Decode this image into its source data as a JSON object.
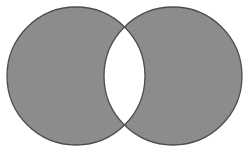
{
  "diagram": {
    "type": "venn",
    "sets": [
      {
        "name": "set-a",
        "shaded": true
      },
      {
        "name": "set-b",
        "shaded": true
      }
    ],
    "intersection_shaded": false,
    "colors": {
      "fill": "#8c8c8c",
      "stroke": "#4d4d4d",
      "background": "#ffffff"
    }
  }
}
